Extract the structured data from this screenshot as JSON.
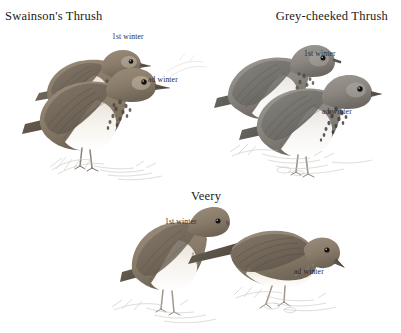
{
  "plate": {
    "kind": "bird-identification-plate",
    "background_color": "#ffffff",
    "ink_color": "#1a1a1a",
    "width": 401,
    "height": 333
  },
  "panels": [
    {
      "id": "swainsons-thrush",
      "title": "Swainson's Thrush",
      "title_align": "left",
      "figures": [
        {
          "id": "swainsons-1st-winter",
          "label": "1st winter",
          "posture": "perched-upright-rear",
          "facing": "right"
        },
        {
          "id": "swainsons-ad-winter",
          "label": "ad winter",
          "posture": "standing-upright-front",
          "facing": "right"
        }
      ]
    },
    {
      "id": "grey-cheeked-thrush",
      "title": "Grey-cheeked Thrush",
      "title_align": "right",
      "figures": [
        {
          "id": "greycheeked-1st-winter",
          "label": "1st winter",
          "posture": "perched-upright-rear",
          "facing": "right"
        },
        {
          "id": "greycheeked-ad-winter",
          "label": "ad winter",
          "posture": "standing-upright-front",
          "facing": "right"
        }
      ]
    },
    {
      "id": "veery",
      "title": "Veery",
      "title_align": "center",
      "figures": [
        {
          "id": "veery-1st-winter",
          "label": "1st winter",
          "posture": "standing-upright",
          "facing": "right"
        },
        {
          "id": "veery-ad-winter",
          "label": "ad winter",
          "posture": "crouched-foraging-horizontal",
          "facing": "right"
        }
      ]
    }
  ],
  "palette": {
    "upper_warm_brown": "#8d7f6e",
    "upper_grey_brown": "#8e8a85",
    "upper_dark": "#6b6359",
    "underpart_pale": "#f2efe9",
    "spot_dark": "#4a443c",
    "ground_line": "#c9c6c0",
    "eye": "#14110e",
    "bill": "#5d564c"
  }
}
